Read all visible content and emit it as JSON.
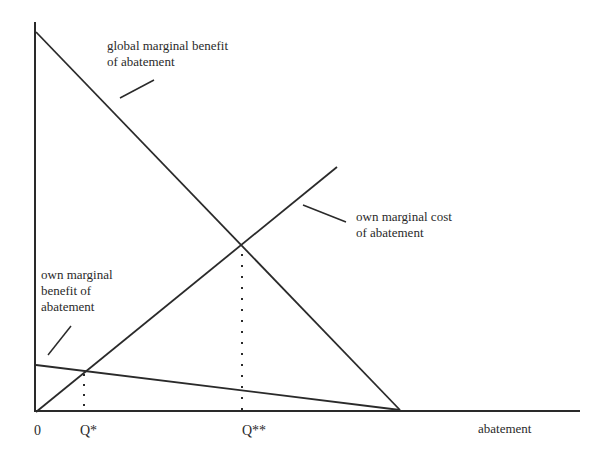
{
  "diagram": {
    "type": "economics-abatement-diagram",
    "axes": {
      "x_label": "abatement",
      "y_label": "",
      "origin_label": "0"
    },
    "tick_labels": {
      "q_star": "Q*",
      "q_double_star": "Q**"
    },
    "curves": [
      {
        "id": "global_mb",
        "label_line1": "global marginal benefit",
        "label_line2": "of abatement",
        "kind": "downward-sloping line",
        "from": [
          36,
          32
        ],
        "to": [
          400,
          410
        ]
      },
      {
        "id": "own_mc",
        "label_line1": "own marginal cost",
        "label_line2": "of abatement",
        "kind": "upward-sloping line",
        "from": [
          36,
          412
        ],
        "to": [
          337,
          167
        ]
      },
      {
        "id": "own_mb",
        "label_line1": "own marginal",
        "label_line2": "benefit of",
        "label_line3": "abatement",
        "kind": "shallow downward-sloping line",
        "from": [
          36,
          365
        ],
        "to": [
          400,
          410
        ]
      }
    ],
    "equilibria": [
      {
        "id": "q_star",
        "description": "own MB = own MC",
        "point": [
          84,
          372
        ]
      },
      {
        "id": "q_double_star",
        "description": "global MB = own MC",
        "point": [
          242,
          250
        ]
      }
    ],
    "colors": {
      "line": "#2a2a2a",
      "background": "#ffffff"
    }
  }
}
